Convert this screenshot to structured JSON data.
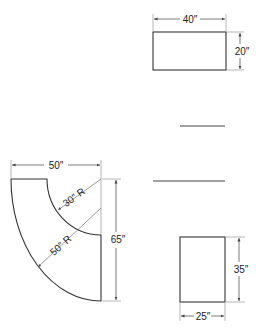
{
  "diagram": {
    "top_rect": {
      "width_label": "40″",
      "height_label": "20″"
    },
    "bottom_rect": {
      "width_label": "25″",
      "height_label": "35″"
    },
    "elbow": {
      "width_label": "50″",
      "height_label": "65″",
      "inner_radius_label": "30″ R",
      "outer_radius_label": "50″ R"
    },
    "colors": {
      "line": "#333333",
      "dim": "#555555"
    }
  }
}
